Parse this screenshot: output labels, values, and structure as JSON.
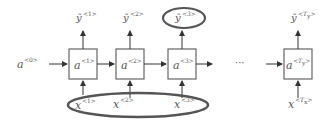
{
  "diagram": {
    "initial_state": {
      "base": "a",
      "sup": "<0>"
    },
    "cells": [
      {
        "id": "cell-1",
        "base": "a",
        "sup": "<1>"
      },
      {
        "id": "cell-2",
        "base": "a",
        "sup": "<2>"
      },
      {
        "id": "cell-3",
        "base": "a",
        "sup": "<3>"
      },
      {
        "id": "cell-Ty",
        "base": "a",
        "sup_open": "<",
        "sup_var": "T",
        "sup_sub": "y",
        "sup_close": ">"
      }
    ],
    "outputs": [
      {
        "id": "yhat-1",
        "base": "ŷ",
        "sup": "<1>"
      },
      {
        "id": "yhat-2",
        "base": "ŷ",
        "sup": "<2>"
      },
      {
        "id": "yhat-3",
        "base": "ŷ",
        "sup": "<3>",
        "circled": true
      },
      {
        "id": "yhat-Ty",
        "base": "ŷ",
        "sup_open": "<",
        "sup_var": "T",
        "sup_sub": "y",
        "sup_close": ">"
      }
    ],
    "inputs": [
      {
        "id": "x-1",
        "base": "x",
        "sup": "<1>"
      },
      {
        "id": "x-2",
        "base": "x",
        "sup": "<2>"
      },
      {
        "id": "x-3",
        "base": "x",
        "sup": "<3>"
      },
      {
        "id": "x-Tx",
        "base": "x",
        "sup_open": "<",
        "sup_var": "T",
        "sup_sub": "x",
        "sup_close": ">"
      }
    ],
    "ellipsis": "···",
    "highlights": {
      "output_ellipse": "ŷ<3> circled",
      "input_ellipse": "x<1>, x<2>, x<3> circled"
    },
    "colors": {
      "stroke": "#555555",
      "arrow": "#333333",
      "background": "#ffffff"
    }
  }
}
